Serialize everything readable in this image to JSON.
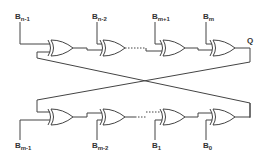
{
  "diagram": {
    "type": "xor-chain-circuit",
    "top_row": {
      "inputs": [
        {
          "base": "B",
          "sub": "n-1"
        },
        {
          "base": "B",
          "sub": "n-2"
        },
        {
          "base": "B",
          "sub": "m+1"
        },
        {
          "base": "B",
          "sub": "m"
        }
      ],
      "output_label": "Q",
      "gate_count": 4,
      "gate_type": "XOR"
    },
    "bottom_row": {
      "inputs": [
        {
          "base": "B",
          "sub": "m-1"
        },
        {
          "base": "B",
          "sub": "m-2"
        },
        {
          "base": "B",
          "sub": "1"
        },
        {
          "base": "B",
          "sub": "0"
        }
      ],
      "gate_count": 4,
      "gate_type": "XOR"
    },
    "connections": "cross-coupled feedback: top output feeds bottom first gate; bottom output feeds top first gate",
    "colors": {
      "line": "#444444",
      "background": "#ffffff"
    }
  }
}
